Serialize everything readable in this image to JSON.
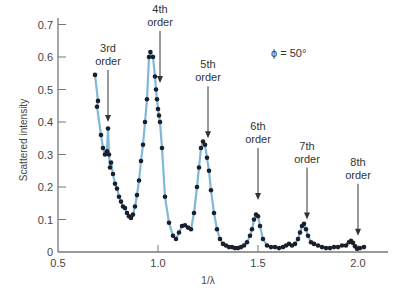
{
  "chart_data": {
    "type": "scatter",
    "title": "",
    "xlabel": "1/λ",
    "ylabel": "Scattered intensity",
    "xlim": [
      0.5,
      2.15
    ],
    "ylim": [
      0,
      0.72
    ],
    "xticks": [
      0.5,
      1.0,
      1.5,
      2.0
    ],
    "xtick_labels": [
      "0.5",
      "1.0",
      "1.5",
      "2.0"
    ],
    "yticks": [
      0,
      0.1,
      0.2,
      0.3,
      0.4,
      0.5,
      0.6,
      0.7
    ],
    "ytick_labels": [
      "0",
      "0.1",
      "0.2",
      "0.3",
      "0.4",
      "0.5",
      "0.6",
      "0.7"
    ],
    "grid": false,
    "legend": null,
    "parameter_label": "ϕ = 50°",
    "colors": {
      "curve": "#7fb8d8",
      "points": "#1a1f2a",
      "axis": "#777777",
      "arrow": "#333333"
    },
    "series": [
      {
        "name": "measured",
        "x": [
          0.685,
          0.7,
          0.695,
          0.715,
          0.725,
          0.735,
          0.745,
          0.75,
          0.755,
          0.76,
          0.765,
          0.775,
          0.785,
          0.795,
          0.805,
          0.815,
          0.825,
          0.835,
          0.845,
          0.855,
          0.865,
          0.875,
          0.885,
          0.895,
          0.905,
          0.915,
          0.925,
          0.935,
          0.945,
          0.955,
          0.962,
          0.975,
          0.985,
          0.99,
          0.995,
          1.0,
          1.005,
          1.01,
          1.02,
          1.035,
          1.055,
          1.075,
          1.09,
          1.105,
          1.12,
          1.135,
          1.15,
          1.165,
          1.18,
          1.195,
          1.205,
          1.215,
          1.225,
          1.235,
          1.245,
          1.255,
          1.265,
          1.28,
          1.295,
          1.31,
          1.325,
          1.34,
          1.355,
          1.37,
          1.385,
          1.4,
          1.415,
          1.43,
          1.445,
          1.46,
          1.47,
          1.48,
          1.49,
          1.5,
          1.51,
          1.525,
          1.545,
          1.565,
          1.585,
          1.605,
          1.625,
          1.64,
          1.655,
          1.67,
          1.685,
          1.7,
          1.71,
          1.72,
          1.73,
          1.74,
          1.75,
          1.765,
          1.78,
          1.8,
          1.82,
          1.84,
          1.86,
          1.88,
          1.9,
          1.92,
          1.94,
          1.955,
          1.965,
          1.975,
          1.985,
          1.995,
          2.01,
          2.03
        ],
        "y": [
          0.545,
          0.465,
          0.447,
          0.36,
          0.32,
          0.3,
          0.31,
          0.38,
          0.3,
          0.26,
          0.275,
          0.24,
          0.21,
          0.195,
          0.17,
          0.155,
          0.14,
          0.135,
          0.12,
          0.11,
          0.105,
          0.115,
          0.14,
          0.175,
          0.22,
          0.28,
          0.33,
          0.4,
          0.47,
          0.6,
          0.615,
          0.6,
          0.54,
          0.5,
          0.47,
          0.44,
          0.42,
          0.4,
          0.32,
          0.17,
          0.09,
          0.05,
          0.04,
          0.06,
          0.08,
          0.082,
          0.075,
          0.07,
          0.12,
          0.2,
          0.26,
          0.32,
          0.34,
          0.33,
          0.29,
          0.25,
          0.19,
          0.12,
          0.07,
          0.04,
          0.025,
          0.02,
          0.015,
          0.015,
          0.012,
          0.012,
          0.015,
          0.02,
          0.03,
          0.05,
          0.07,
          0.1,
          0.115,
          0.11,
          0.08,
          0.04,
          0.02,
          0.015,
          0.015,
          0.012,
          0.015,
          0.02,
          0.025,
          0.02,
          0.025,
          0.04,
          0.06,
          0.08,
          0.087,
          0.07,
          0.05,
          0.03,
          0.025,
          0.02,
          0.015,
          0.012,
          0.012,
          0.015,
          0.015,
          0.02,
          0.02,
          0.03,
          0.034,
          0.028,
          0.018,
          0.01,
          0.012,
          0.015
        ]
      }
    ],
    "annotations": [
      {
        "label_line1": "3rd",
        "label_line2": "order",
        "x": 0.75,
        "arrow_tip_y": 0.4
      },
      {
        "label_line1": "4th",
        "label_line2": "order",
        "x": 1.01,
        "arrow_tip_y": 0.52
      },
      {
        "label_line1": "5th",
        "label_line2": "order",
        "x": 1.25,
        "arrow_tip_y": 0.35
      },
      {
        "label_line1": "6th",
        "label_line2": "order",
        "x": 1.5,
        "arrow_tip_y": 0.16
      },
      {
        "label_line1": "7th",
        "label_line2": "order",
        "x": 1.745,
        "arrow_tip_y": 0.1
      },
      {
        "label_line1": "8th",
        "label_line2": "order",
        "x": 2.0,
        "arrow_tip_y": 0.05
      }
    ]
  }
}
